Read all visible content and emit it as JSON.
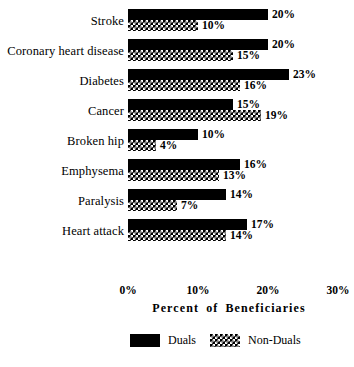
{
  "chart_data": {
    "type": "bar",
    "orientation": "horizontal",
    "title": "",
    "xlabel": "Percent of Beneficiaries",
    "ylabel": "",
    "xlim": [
      0,
      30
    ],
    "xticks": [
      "0%",
      "10%",
      "20%",
      "30%"
    ],
    "xtick_values": [
      0,
      10,
      20,
      30
    ],
    "grid": false,
    "legend_position": "bottom",
    "categories": [
      "Stroke",
      "Coronary heart disease",
      "Diabetes",
      "Cancer",
      "Broken hip",
      "Emphysema",
      "Paralysis",
      "Heart attack"
    ],
    "series": [
      {
        "name": "Duals",
        "color": "#000000",
        "fill": "solid",
        "values": [
          20,
          20,
          23,
          15,
          10,
          16,
          14,
          17
        ],
        "labels": [
          "20%",
          "20%",
          "23%",
          "15%",
          "10%",
          "16%",
          "14%",
          "17%"
        ]
      },
      {
        "name": "Non-Duals",
        "color": "#000000",
        "fill": "checkerboard",
        "values": [
          10,
          15,
          16,
          19,
          4,
          13,
          7,
          14
        ],
        "labels": [
          "10%",
          "15%",
          "16%",
          "19%",
          "4%",
          "13%",
          "7%",
          "14%"
        ]
      }
    ]
  },
  "legend": {
    "items": [
      {
        "label": "Duals"
      },
      {
        "label": "Non-Duals"
      }
    ]
  },
  "axis": {
    "title": "Percent of Beneficiaries"
  }
}
